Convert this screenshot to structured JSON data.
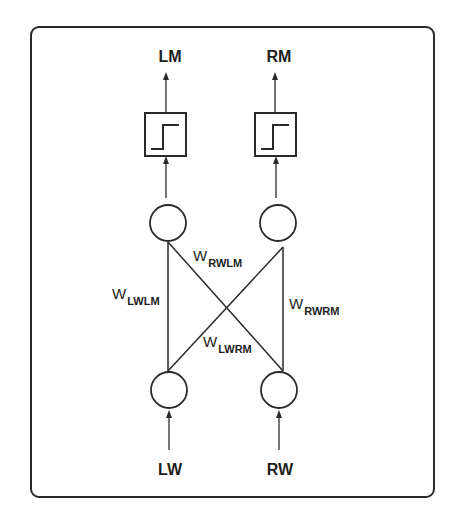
{
  "diagram": {
    "type": "braitenberg-vehicle-network",
    "outputs": [
      {
        "id": "LM",
        "label": "LM"
      },
      {
        "id": "RM",
        "label": "RM"
      }
    ],
    "inputs": [
      {
        "id": "LW",
        "label": "LW"
      },
      {
        "id": "RW",
        "label": "RW"
      }
    ],
    "activation": "step-function",
    "weights": [
      {
        "id": "LWLM",
        "symbol": "W",
        "subscript": "LWLM",
        "from": "LW",
        "to": "LM"
      },
      {
        "id": "RWLM",
        "symbol": "W",
        "subscript": "RWLM",
        "from": "RW",
        "to": "LM"
      },
      {
        "id": "LWRM",
        "symbol": "W",
        "subscript": "LWRM",
        "from": "LW",
        "to": "RM"
      },
      {
        "id": "RWRM",
        "symbol": "W",
        "subscript": "RWRM",
        "from": "RW",
        "to": "RM"
      }
    ],
    "colors": {
      "stroke": "#2a2a2a",
      "background": "#ffffff"
    }
  }
}
